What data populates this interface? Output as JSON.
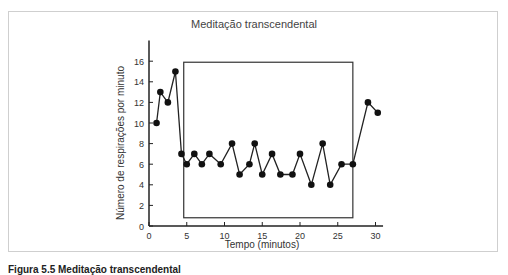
{
  "chart_data": {
    "type": "line",
    "title": "Meditação transcendental",
    "xlabel": "Tempo (minutos)",
    "ylabel": "Número de respirações por minuto",
    "xlim": [
      0,
      31
    ],
    "ylim": [
      0,
      18
    ],
    "xticks": [
      0,
      5,
      10,
      15,
      20,
      25,
      30
    ],
    "yticks": [
      0,
      2,
      4,
      6,
      8,
      10,
      12,
      14,
      16
    ],
    "grid": false,
    "legend": null,
    "series": [
      {
        "name": "Respirações por minuto",
        "x": [
          1,
          1.5,
          2.5,
          3.5,
          4.3,
          5,
          6,
          7,
          8,
          9.5,
          11,
          12,
          13.3,
          14,
          15,
          16.3,
          17.4,
          19,
          20,
          21.5,
          23,
          24,
          25.5,
          27,
          29,
          30.3
        ],
        "y": [
          10,
          13,
          12,
          15,
          7,
          6,
          7,
          6,
          7,
          6,
          8,
          5,
          6,
          8,
          5,
          7,
          5,
          5,
          7,
          4,
          8,
          4,
          6,
          6,
          12,
          11
        ]
      }
    ],
    "annotations": [
      {
        "type": "rectangle",
        "label": "Meditation period",
        "x0": 4.6,
        "x1": 27,
        "y0": 0.8,
        "y1": 15.9
      }
    ]
  },
  "caption": "Figura 5.5 Meditação transcendental"
}
